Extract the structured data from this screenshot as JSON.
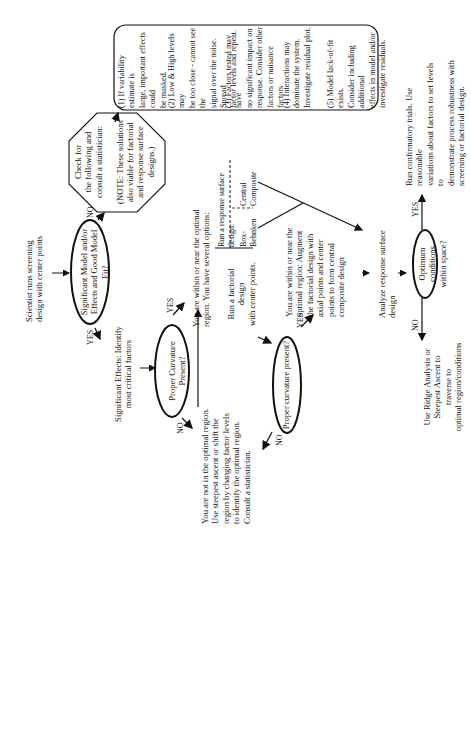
{
  "diagram": {
    "type": "flowchart",
    "orientation": "rotated-90-ccw",
    "nodes": {
      "start": "Scientist runs screening\ndesign with center points",
      "q_model": "Significant Model and/or\nEffects and Good Model Fit?",
      "check": "Check for\nthe following and\nconsult a statistician:\n\n(NOTE: These solutions\nalso viable for factorial\nand response surface\ndesigns.)",
      "checklist": [
        "(1) If variability estimate is\nlarge, important effects could\nbe masked.",
        "(2) Low & High levels may\nbe too close - cannot see the\nsignal over the noise.  Spread\nfactor levels and repeat.",
        "(3) Factors tested may have\nno significant impact on\nresponse.  Consider other\nfactors or nuisance factors",
        "(4) Interactions may\ndominate the system.\nInvestigate residual plot.",
        "(5) Model lack-of-fit exists.\nConsider including additional\neffects in model and/or\ninvestigate residuals."
      ],
      "sig_effects": "Significant Effects:  Identify\nmost critical factors",
      "q_curv1": "Proper Curvature Present?",
      "within_options": "You are within or near the optimal\nregion.  You have several options:",
      "factorial_cp": "Run a factorial design\nwith center points.",
      "rsd_header": "Run  a response surface design:",
      "rsd_bb": "Box-Behnken",
      "rsd_cc": "Central Composite",
      "not_optimal": "You are not in the optimal region.\nUse steepest ascent or shift the\nregion by changing factor levels\nto identify the optimal region.\nConsult a statistician.",
      "q_curv2": "Proper curvature present?",
      "augment": "You are within or near the\noptimal region:  Augment\nthe factorial design with\naxial points and center\npoints to form central\ncomposite design",
      "analyze": "Analyze response surface design",
      "q_optimum": "Optimum conditions\nwithin space?",
      "confirm": "Run confirmatory trials.  Use reasonable\nvariations about factors to set levels to\ndemonstrate process robustness with\nscreening or factorial design.",
      "ridge": "Use Ridge Analysis or\nSteepest Ascent to traverse to\noptimal region/conditions"
    },
    "labels": {
      "no1": "NO",
      "yes1": "YES",
      "yes2": "YES",
      "no2": "NO",
      "yes3": "YES",
      "no3": "NO",
      "yes4": "YES",
      "no4": "NO"
    },
    "colors": {
      "stroke": "#111111",
      "background": "#ffffff"
    }
  }
}
